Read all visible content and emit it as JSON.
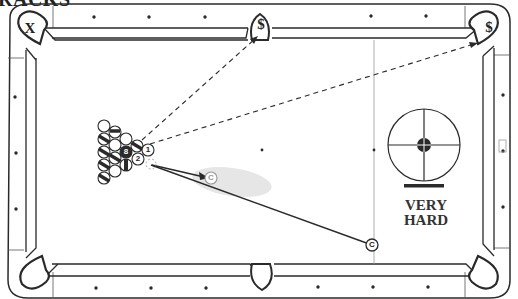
{
  "title": "RACKS",
  "pockets": {
    "top_left": {
      "label": "X",
      "meaning": "wrong pocket"
    },
    "top_middle": {
      "label": "$",
      "meaning": "target pocket"
    },
    "top_right": {
      "label": "$",
      "meaning": "target pocket"
    },
    "bottom_left": {
      "label": ""
    },
    "bottom_middle": {
      "label": ""
    },
    "bottom_right": {
      "label": ""
    }
  },
  "balls": {
    "one": "1",
    "two": "2",
    "eight": "8",
    "cue_start": "C",
    "cue_end": "C"
  },
  "difficulty": {
    "line1": "VERY",
    "line2": "HARD"
  },
  "colors": {
    "line": "#2a2a2a",
    "cloth": "#ffffff",
    "shade": "#e6e6e6",
    "label_gray": "#9a9a9a"
  }
}
